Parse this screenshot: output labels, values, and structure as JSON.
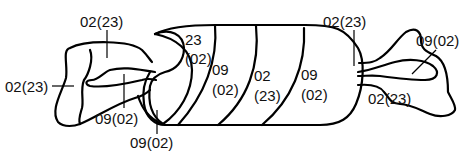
{
  "diagram": {
    "stroke_color": "#000000",
    "background": "#ffffff",
    "left_end_labels": {
      "top": "02(23)",
      "left": "02(23)",
      "inner": "09(02)",
      "bottom": "09(02)"
    },
    "body_bands": [
      {
        "line1": "23",
        "line2": "(02)"
      },
      {
        "line1": "09",
        "line2": "(02)"
      },
      {
        "line1": "02",
        "line2": "(23)"
      },
      {
        "line1": "09",
        "line2": "(02)"
      }
    ],
    "right_end_labels": {
      "top": "02(23)",
      "right": "09(02)",
      "bottom": "02(23)"
    }
  }
}
